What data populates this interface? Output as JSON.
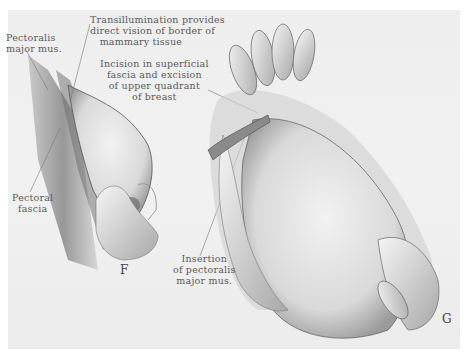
{
  "figure": {
    "panels": [
      {
        "letter": "F",
        "description": "transillumination of breast, left view"
      },
      {
        "letter": "G",
        "description": "incision and excision of upper quadrant, right view"
      }
    ],
    "labels": {
      "transillumination": "Transillumination provides\ndirect vision of border of\n   mammary tissue",
      "pectoralis_major": "Pectoralis\nmajor mus.",
      "incision": "Incision in superficial\nfascia and excision\nof upper quadrant\nof breast",
      "pectoral_fascia": "Pectoral\nfascia",
      "insertion": "Insertion\nof pectoralis\nmajor mus."
    },
    "colors": {
      "background": "#eeeeee",
      "ink": "#5a5a5a",
      "shadow": "#3a3a3a"
    }
  }
}
